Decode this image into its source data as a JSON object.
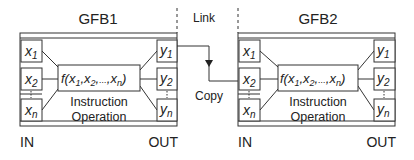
{
  "blocks": [
    {
      "title": "GFB1",
      "inputs": [
        {
          "base": "x",
          "sub": "1"
        },
        {
          "base": "x",
          "sub": "2"
        },
        {
          "base": "x",
          "sub": "n"
        }
      ],
      "outputs": [
        {
          "base": "y",
          "sub": "1"
        },
        {
          "base": "y",
          "sub": "2"
        },
        {
          "base": "y",
          "sub": "n"
        }
      ],
      "function": {
        "name": "f(",
        "args": [
          {
            "base": "x",
            "sub": "1"
          },
          {
            "base": "x",
            "sub": "2"
          },
          {
            "base": "x",
            "sub": "n"
          }
        ],
        "ellipsis": "...",
        "close": ")"
      },
      "caption_line1": "Instruction",
      "caption_line2": "Operation",
      "in_label": "IN",
      "out_label": "OUT"
    },
    {
      "title": "GFB2",
      "inputs": [
        {
          "base": "x",
          "sub": "1"
        },
        {
          "base": "x",
          "sub": "2"
        },
        {
          "base": "x",
          "sub": "n"
        }
      ],
      "outputs": [
        {
          "base": "y",
          "sub": "1"
        },
        {
          "base": "y",
          "sub": "2"
        },
        {
          "base": "y",
          "sub": "n"
        }
      ],
      "function": {
        "name": "f(",
        "args": [
          {
            "base": "x",
            "sub": "1"
          },
          {
            "base": "x",
            "sub": "2"
          },
          {
            "base": "x",
            "sub": "n"
          }
        ],
        "ellipsis": "...",
        "close": ")"
      },
      "caption_line1": "Instruction",
      "caption_line2": "Operation",
      "in_label": "IN",
      "out_label": "OUT"
    }
  ],
  "connection": {
    "link_label": "Link",
    "copy_label": "Copy",
    "from": "GFB1.y1",
    "to": "GFB2.x2"
  },
  "colors": {
    "stroke": "#333333",
    "text": "#222222",
    "background": "#ffffff"
  }
}
